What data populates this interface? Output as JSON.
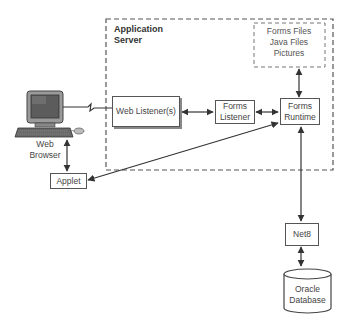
{
  "diagram": {
    "container": {
      "title_line1": "Application",
      "title_line2": "Server",
      "style": "dashed"
    },
    "files_store": {
      "items": [
        "Forms  Files",
        "Java Files",
        "Pictures"
      ],
      "style": "dashed"
    },
    "client": {
      "label_line1": "Web",
      "label_line2": "Browser",
      "icon": "desktop-computer-icon"
    },
    "nodes": {
      "web_listener": "Web Listener(s)",
      "forms_listener_line1": "Forms",
      "forms_listener_line2": "Listener",
      "forms_runtime_line1": "Forms",
      "forms_runtime_line2": "Runtime",
      "applet": "Applet",
      "net8": "Net8",
      "database_line1": "Oracle",
      "database_line2": "Database"
    },
    "connections": [
      {
        "from": "Web Browser",
        "to": "Web Listener(s)",
        "type": "network-zigzag"
      },
      {
        "from": "Web Listener(s)",
        "to": "Forms Listener",
        "type": "bidirectional"
      },
      {
        "from": "Forms Listener",
        "to": "Forms Runtime",
        "type": "bidirectional"
      },
      {
        "from": "Forms Runtime",
        "to": "Forms Files / Java Files / Pictures",
        "type": "bidirectional"
      },
      {
        "from": "Web Browser",
        "to": "Applet",
        "type": "bidirectional"
      },
      {
        "from": "Applet",
        "to": "Forms Runtime",
        "type": "bidirectional"
      },
      {
        "from": "Forms Runtime",
        "to": "Net8",
        "type": "bidirectional"
      },
      {
        "from": "Net8",
        "to": "Oracle Database",
        "type": "bidirectional"
      }
    ]
  }
}
